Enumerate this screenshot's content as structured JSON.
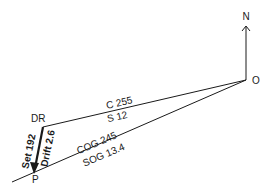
{
  "diagram": {
    "type": "current-triangle",
    "colors": {
      "ink": "#1a1a1a",
      "background": "#ffffff"
    },
    "points": {
      "origin": {
        "label": "O"
      },
      "dead_reckoning": {
        "label": "DR"
      },
      "position": {
        "label": "P"
      }
    },
    "north_arrow": {
      "label": "N"
    },
    "course_line": {
      "course_label": "C 255",
      "speed_label": "S   12"
    },
    "ground_track": {
      "cog_label": "COG 245",
      "sog_label": "SOG 13.4"
    },
    "current_vector": {
      "set_label": "Set 192",
      "drift_label": "Drift 2.6"
    }
  }
}
